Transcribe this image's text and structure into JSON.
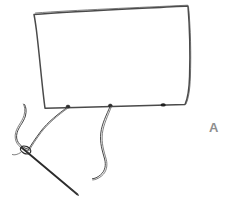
{
  "figure": {
    "panel_label": "A",
    "panel_label_color": "#8e8e8e",
    "background_color": "#ffffff",
    "ink_color": "#3b3b3b",
    "outline_color": "#4a4a4a",
    "elements": {
      "fabric_patch": "rectangular-patch-outline",
      "left_thread": "thread-through-needle",
      "right_thread": "loose-hanging-thread",
      "needle": "sewing-needle",
      "needle_eye": "needle-eye-loop",
      "stitch_points": "thread-attachment-knots",
      "edge_mark": "dark-knot-mark-on-lower-edge"
    },
    "icon_names": {
      "needle": "needle-icon",
      "thread": "thread-icon",
      "patch": "fabric-patch-icon"
    }
  }
}
